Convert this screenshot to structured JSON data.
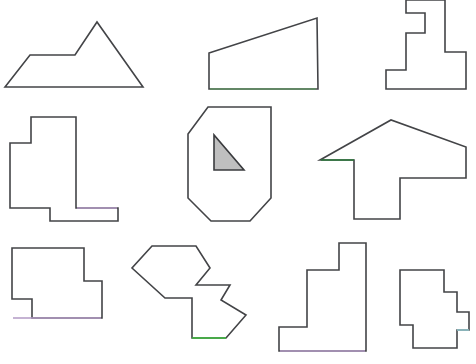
{
  "figure": {
    "background_color": "#ffffff",
    "width": 476,
    "height": 364,
    "default_stroke_color": "#434447",
    "default_fill_color": "#ffffff",
    "stroke_width": 1.6,
    "shape_count": 9,
    "row_count": 3,
    "column_count": 3
  },
  "palette": {
    "outline": "#434447",
    "fill": "#ffffff",
    "triangle_fill": "#bfbfbf",
    "triangle_stroke": "#3a3b3e",
    "green_bright": "#3dbd3d",
    "green_dark": "#2d7a3d",
    "green_muted": "#5f8f62",
    "purple": "#b29ac4",
    "cyan": "#8fc0c6"
  },
  "shapes": [
    {
      "id": "shape-1",
      "name": "mountain-pentagon",
      "row": 1,
      "column": 1,
      "label": "Mountain Pentagon",
      "vertex_count": 5,
      "points": "5,87 30,55 75,55 97,22 143,87",
      "fill": "#ffffff",
      "stroke": "#434447",
      "accents": []
    },
    {
      "id": "shape-2",
      "name": "right-trapezoid",
      "row": 1,
      "column": 2,
      "label": "Right Trapezoid",
      "vertex_count": 4,
      "points": "209,53 317,18 318,89 209,89",
      "fill": "#ffffff",
      "stroke": "#434447",
      "accents": [
        {
          "name": "green-bottom-edge",
          "points": "210,89 316,89",
          "color": "#5f8f62"
        }
      ]
    },
    {
      "id": "shape-3",
      "name": "stepped-tower-polygon",
      "row": 1,
      "column": 3,
      "label": "Stepped Tower Polygon",
      "vertex_count": 12,
      "points": "406,0 406,13 425,13 425,33 406,33 406,70 386,70 386,89 466,89 466,52 445,52 445,0",
      "fill": "#ffffff",
      "stroke": "#434447",
      "accents": []
    },
    {
      "id": "shape-4",
      "name": "notched-block-polygon",
      "row": 2,
      "column": 1,
      "label": "Notched Block Polygon",
      "vertex_count": 10,
      "points": "31,117 31,143 10,143 10,208 50,208 50,221 118,221 118,208 76,208 76,117",
      "fill": "#ffffff",
      "stroke": "#434447",
      "accents": [
        {
          "name": "purple-ledge-edge",
          "points": "77,208 117,208",
          "color": "#b29ac4"
        }
      ]
    },
    {
      "id": "shape-5",
      "name": "octagon-with-triangle",
      "row": 2,
      "column": 2,
      "label": "Octagon With Inner Triangle",
      "vertex_count": 8,
      "points": "208,107 271,107 271,198 250,221 211,221 188,198 188,134",
      "fill": "#ffffff",
      "stroke": "#434447",
      "accents": [],
      "inner": {
        "name": "gray-right-triangle",
        "label": "Gray Right Triangle",
        "points": "214,135 214,170 244,170",
        "fill": "#bfbfbf",
        "stroke": "#3a3b3e"
      }
    },
    {
      "id": "shape-6",
      "name": "arrow-polygon",
      "row": 2,
      "column": 3,
      "label": "Arrow Polygon",
      "vertex_count": 8,
      "points": "320,160 391,120 466,147 466,178 400,178 400,219 354,219 354,160",
      "fill": "#ffffff",
      "stroke": "#434447",
      "accents": [
        {
          "name": "green-arrow-base-edge",
          "points": "321,160 354,160",
          "color": "#2d7a3d"
        }
      ]
    },
    {
      "id": "shape-7",
      "name": "stepped-rectangle-polygon",
      "row": 3,
      "column": 1,
      "label": "Stepped Rectangle Polygon",
      "vertex_count": 8,
      "points": "31,248 84,248 84,281 102,281 102,318 32,318 32,299 12,299 12,248",
      "fill": "#ffffff",
      "stroke": "#434447",
      "accents": [
        {
          "name": "purple-bottom-edge",
          "points": "13,318 101,318",
          "color": "#b29ac4"
        }
      ],
      "points_note": "drawn clockwise from top-left notch"
    },
    {
      "id": "shape-8",
      "name": "zigzag-arrow-polygon",
      "row": 3,
      "column": 2,
      "label": "Zigzag Arrow Polygon",
      "vertex_count": 12,
      "points": "152,246 196,246 210,268 196,285 230,285 221,300 246,315 226,338 192,338 192,298 165,298 132,268",
      "fill": "#ffffff",
      "stroke": "#434447",
      "accents": [
        {
          "name": "bright-green-bottom-edge",
          "points": "192,338 226,338",
          "color": "#3dbd3d"
        }
      ]
    },
    {
      "id": "shape-9",
      "name": "staircase-polygon",
      "row": 3,
      "column": 3,
      "label": "Staircase Polygon",
      "vertex_count": 8,
      "points": "339,243 339,270 307,270 307,327 279,327 279,351 366,351 366,243",
      "fill": "#ffffff",
      "stroke": "#434447",
      "accents": [
        {
          "name": "purple-bottom-edge",
          "points": "280,351 365,351",
          "color": "#b29ac4"
        }
      ]
    },
    {
      "id": "shape-10",
      "name": "terraced-step-polygon",
      "row": 3,
      "column": 4,
      "label": "Terraced Step Polygon",
      "vertex_count": 12,
      "points": "399,268 399,288 414,288 414,305 429,305 429,322 455,322 455,342 412,342 412,325 399,325 399,268",
      "fill": "#ffffff",
      "stroke": "#434447",
      "accents": []
    }
  ],
  "shape_10_full": {
    "name": "terraced-step-polygon",
    "points": "400,270 444,270 444,292 457,292 457,312 469,312 469,330 457,330 457,348 413,348 413,325 400,325",
    "accents": [
      {
        "name": "cyan-step-edge",
        "points": "457,330 469,330",
        "color": "#8fc0c6"
      }
    ]
  }
}
